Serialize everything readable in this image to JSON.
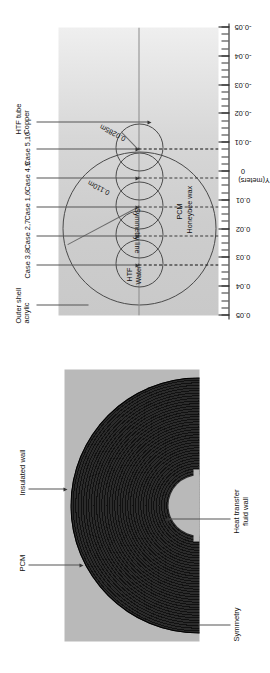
{
  "figure": {
    "orientation": "rotated-90-ccw",
    "panels": [
      {
        "id": "mesh",
        "annotations": {
          "pcm": "PCM",
          "insulated_wall": "Insulated wall",
          "symmetry": "Symmetry",
          "heat_transfer_fluid_wall": "Heat transfer\nfluid wall",
          "heat_transfer_fluid_wall_line1": "Heat transfer",
          "heat_transfer_fluid_wall_line2": "fluid wall"
        }
      },
      {
        "id": "schematic",
        "callouts": [
          {
            "line1": "Outer shell",
            "line2": "acrylic",
            "line3": ""
          },
          {
            "line1": "Case 3,8",
            "line2": "",
            "line3": ""
          },
          {
            "line1": "Case 2,7",
            "line2": "",
            "line3": ""
          },
          {
            "line1": "Case 1,6",
            "line2": "",
            "line3": ""
          },
          {
            "line1": "Case 4,9",
            "line2": "",
            "line3": ""
          },
          {
            "line1": "Case 5,10",
            "line2": "",
            "line3": ""
          },
          {
            "line1": "HTF tube",
            "line2": "Copper",
            "line3": ""
          }
        ],
        "inner_labels": {
          "htf": "HTF",
          "water": "Water",
          "symmetry_line": "Symmetry line",
          "pcm": "PCM",
          "honeybee_wax": "Honeybee wax",
          "dim_outer": "0.110m",
          "dim_tube": "0.0285m"
        }
      }
    ]
  },
  "chart_data": {
    "type": "scatter",
    "title": "",
    "xlabel": "",
    "ylabel": "Y(meters)",
    "ylim": [
      -0.05,
      0.05
    ],
    "grid": false,
    "legend_position": "none",
    "axis": {
      "name": "Y(meters)",
      "tick_labels": [
        "0.05",
        "0.04",
        "0.03",
        "0.02",
        "0.01",
        "0",
        "-0.01",
        "-0.02",
        "-0.03",
        "-0.04",
        "-0.05"
      ],
      "tick_values": [
        0.05,
        0.04,
        0.03,
        0.02,
        0.01,
        0,
        -0.01,
        -0.02,
        -0.03,
        -0.04,
        -0.05
      ],
      "minor_tick_step": 0.0025
    },
    "geometry": {
      "outer_shell_diameter_m": 0.11,
      "htf_tube_diameter_m": 0.0285,
      "units": "m",
      "tube_centers_y_m": [
        0.04,
        0.02,
        0.0,
        -0.02,
        -0.04
      ],
      "tube_case_ids": [
        "Case 3,8",
        "Case 2,7",
        "Case 1,6",
        "Case 4,9",
        "Case 5,10"
      ]
    },
    "annotations": [
      {
        "text": "0.110m",
        "kind": "dimension",
        "value": 0.11
      },
      {
        "text": "0.0285m",
        "kind": "dimension",
        "value": 0.0285
      },
      {
        "text": "Symmetry line",
        "kind": "label"
      },
      {
        "text": "HTF",
        "kind": "label"
      },
      {
        "text": "Water",
        "kind": "label"
      },
      {
        "text": "PCM",
        "kind": "label"
      },
      {
        "text": "Honeybee wax",
        "kind": "label"
      }
    ]
  },
  "colors": {
    "mesh_dark": "#151515",
    "mesh_background": "#b9b9b9",
    "plot_background_left": "#c9c9c9",
    "plot_background_right": "#efefef",
    "line": "#4a4a4a",
    "text": "#111111"
  }
}
